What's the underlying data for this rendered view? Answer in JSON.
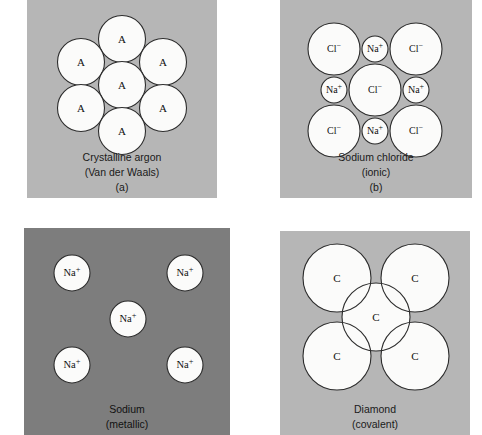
{
  "figure": {
    "background": "#ffffff",
    "panel_bg_light": "#b6b6b6",
    "panel_bg_dark": "#7d7d7d",
    "circle_fill": "#fbfbfa",
    "circle_stroke": "#2c2c2c",
    "caption_color": "#1a1a1a"
  },
  "panels": [
    {
      "id": "a",
      "name": "crystalline-argon",
      "background": "#b6b6b6",
      "bonding": "Van der Waals",
      "caption": {
        "line1": "Crystalline argon",
        "line2": "(Van der Waals)",
        "line3": "(a)"
      },
      "atoms": [
        {
          "label": "A",
          "sup": "",
          "cx": 95,
          "cy": 39,
          "r": 23.5
        },
        {
          "label": "A",
          "sup": "",
          "cx": 54,
          "cy": 62,
          "r": 23.5
        },
        {
          "label": "A",
          "sup": "",
          "cx": 136,
          "cy": 62,
          "r": 23.5
        },
        {
          "label": "A",
          "sup": "",
          "cx": 95,
          "cy": 85,
          "r": 23.5
        },
        {
          "label": "A",
          "sup": "",
          "cx": 54,
          "cy": 108,
          "r": 23.5
        },
        {
          "label": "A",
          "sup": "",
          "cx": 136,
          "cy": 108,
          "r": 23.5
        },
        {
          "label": "A",
          "sup": "",
          "cx": 95,
          "cy": 131,
          "r": 23.5
        }
      ]
    },
    {
      "id": "b",
      "name": "sodium-chloride",
      "background": "#b6b6b6",
      "bonding": "ionic",
      "caption": {
        "line1": "Sodium chloride",
        "line2": "(ionic)",
        "line3": "(b)"
      },
      "atoms": [
        {
          "label": "Cl",
          "sup": "−",
          "cx": 54,
          "cy": 49,
          "r": 26
        },
        {
          "label": "Cl",
          "sup": "−",
          "cx": 136,
          "cy": 49,
          "r": 26
        },
        {
          "label": "Cl",
          "sup": "−",
          "cx": 95,
          "cy": 90,
          "r": 26
        },
        {
          "label": "Cl",
          "sup": "−",
          "cx": 54,
          "cy": 131,
          "r": 26
        },
        {
          "label": "Cl",
          "sup": "−",
          "cx": 136,
          "cy": 131,
          "r": 26
        },
        {
          "label": "Na",
          "sup": "+",
          "cx": 95,
          "cy": 49,
          "r": 13
        },
        {
          "label": "Na",
          "sup": "+",
          "cx": 54,
          "cy": 90,
          "r": 13
        },
        {
          "label": "Na",
          "sup": "+",
          "cx": 136,
          "cy": 90,
          "r": 13
        },
        {
          "label": "Na",
          "sup": "+",
          "cx": 95,
          "cy": 131,
          "r": 13
        }
      ]
    },
    {
      "id": "c",
      "name": "sodium-metallic",
      "background": "#7d7d7d",
      "bonding": "metallic",
      "caption": {
        "line1": "Sodium",
        "line2": "(metallic)",
        "line3": ""
      },
      "atoms": [
        {
          "label": "Na",
          "sup": "+",
          "cx": 48,
          "cy": 45,
          "r": 18
        },
        {
          "label": "Na",
          "sup": "+",
          "cx": 161,
          "cy": 45,
          "r": 18
        },
        {
          "label": "Na",
          "sup": "+",
          "cx": 104,
          "cy": 91,
          "r": 18
        },
        {
          "label": "Na",
          "sup": "+",
          "cx": 48,
          "cy": 137,
          "r": 18
        },
        {
          "label": "Na",
          "sup": "+",
          "cx": 161,
          "cy": 137,
          "r": 18
        }
      ]
    },
    {
      "id": "d",
      "name": "diamond-covalent",
      "background": "#b6b6b6",
      "bonding": "covalent",
      "caption": {
        "line1": "Diamond",
        "line2": "(covalent)",
        "line3": ""
      },
      "atoms": [
        {
          "label": "C",
          "sup": "",
          "cx": 57,
          "cy": 47,
          "r": 34
        },
        {
          "label": "C",
          "sup": "",
          "cx": 135,
          "cy": 47,
          "r": 34
        },
        {
          "label": "C",
          "sup": "",
          "cx": 96,
          "cy": 86,
          "r": 34
        },
        {
          "label": "C",
          "sup": "",
          "cx": 57,
          "cy": 125,
          "r": 34
        },
        {
          "label": "C",
          "sup": "",
          "cx": 135,
          "cy": 125,
          "r": 34
        }
      ]
    }
  ],
  "chart_data": {
    "type": "diagram",
    "subtype": "schematic packing diagrams",
    "panel_count": 4,
    "panels": [
      {
        "letter": "(a)",
        "substance": "Crystalline argon",
        "bond_type": "Van der Waals",
        "species": [
          "A"
        ],
        "atom_count": 7,
        "arrangement": "hexagonal close packed, one central atom surrounded by six equal atoms, all tangent"
      },
      {
        "letter": "(b)",
        "substance": "Sodium chloride",
        "bond_type": "ionic",
        "species": [
          "Cl−",
          "Na+"
        ],
        "atom_count": 9,
        "counts": {
          "Cl−": 5,
          "Na+": 4
        },
        "arrangement": "large chloride ions at four corners and center, small sodium ions at four edge midpoints, all tangent"
      },
      {
        "letter": "(c)",
        "substance": "Sodium",
        "bond_type": "metallic",
        "species": [
          "Na+"
        ],
        "atom_count": 5,
        "arrangement": "five separated sodium ions on dark background representing delocalized electron sea"
      },
      {
        "letter": "(d)",
        "substance": "Diamond",
        "bond_type": "covalent",
        "species": [
          "C"
        ],
        "atom_count": 5,
        "arrangement": "four corner carbon atoms overlapping a central carbon atom, showing shared electron orbital overlap"
      }
    ]
  }
}
